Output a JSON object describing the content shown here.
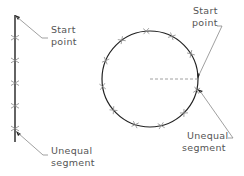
{
  "diagram": {
    "line_figure": {
      "label_start": [
        "Start",
        "point"
      ],
      "label_unequal": [
        "Unequal",
        "segment"
      ],
      "division_marks": 5
    },
    "circle_figure": {
      "label_start": [
        "Start",
        "point"
      ],
      "label_unequal": [
        "Unequal",
        "segment"
      ],
      "division_marks": 11
    },
    "colors": {
      "stroke": "#222222",
      "mark": "#888888",
      "leader": "#888888",
      "text": "#555555"
    }
  }
}
